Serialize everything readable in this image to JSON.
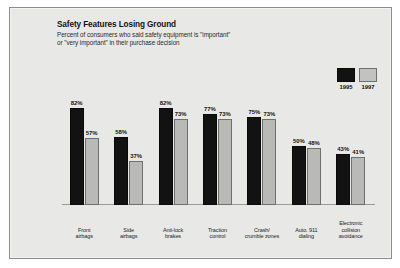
{
  "chart_data": {
    "type": "bar",
    "title": "Safety Features Losing Ground",
    "subtitle_line1": "Percent of consumers who said safety equipment is \"important\"",
    "subtitle_line2": "or \"very important\" in their purchase decision",
    "xlabel": "",
    "ylabel": "",
    "ylim": [
      0,
      100
    ],
    "grid": false,
    "legend_position": "top-right",
    "categories": [
      "Front airbags",
      "Side airbags",
      "Anti-lock brakes",
      "Traction control",
      "Crash/ crumble zones",
      "Auto. 911 dialing",
      "Electronic collision avoidance"
    ],
    "category_lines": [
      [
        "Front",
        "airbags"
      ],
      [
        "Side",
        "airbags"
      ],
      [
        "Anti-lock",
        "brakes"
      ],
      [
        "Traction",
        "control"
      ],
      [
        "Crash/",
        "crumble zones"
      ],
      [
        "Auto. 911",
        "dialing"
      ],
      [
        "Electronic",
        "collision",
        "avoidance"
      ]
    ],
    "series": [
      {
        "name": "1995",
        "color": "#121212",
        "values": [
          82,
          58,
          82,
          77,
          75,
          50,
          43
        ],
        "value_labels": [
          "82%",
          "58%",
          "82%",
          "77%",
          "75%",
          "50%",
          "43%"
        ]
      },
      {
        "name": "1997",
        "color": "#b9b9b7",
        "values": [
          57,
          37,
          73,
          73,
          73,
          48,
          41
        ],
        "value_labels": [
          "57%",
          "37%",
          "73%",
          "73%",
          "73%",
          "48%",
          "41%"
        ]
      }
    ]
  },
  "legend": {
    "items": [
      {
        "label": "1995",
        "swatch": "black"
      },
      {
        "label": "1997",
        "swatch": "gray"
      }
    ]
  }
}
